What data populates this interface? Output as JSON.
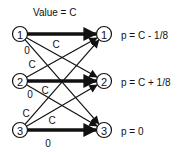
{
  "diagram": {
    "title": "Value = C",
    "left_nodes": [
      {
        "id": "1",
        "label": "1",
        "x": 20,
        "y": 34
      },
      {
        "id": "2",
        "label": "2",
        "x": 20,
        "y": 81
      },
      {
        "id": "3",
        "label": "3",
        "x": 20,
        "y": 130
      }
    ],
    "right_nodes": [
      {
        "id": "1",
        "label": "1",
        "x": 104,
        "y": 34,
        "prob": "p = C - 1/8"
      },
      {
        "id": "2",
        "label": "2",
        "x": 104,
        "y": 81,
        "prob": "p = C + 1/8"
      },
      {
        "id": "3",
        "label": "3",
        "x": 104,
        "y": 130,
        "prob": "p = 0"
      }
    ],
    "edge_labels": [
      {
        "text": "C",
        "x": 56,
        "y": 44
      },
      {
        "text": "0",
        "x": 27,
        "y": 50
      },
      {
        "text": "C",
        "x": 32,
        "y": 64
      },
      {
        "text": "C",
        "x": 45,
        "y": 90
      },
      {
        "text": "0",
        "x": 30,
        "y": 94
      },
      {
        "text": "C",
        "x": 26,
        "y": 113
      },
      {
        "text": "C",
        "x": 52,
        "y": 120
      },
      {
        "text": "0",
        "x": 48,
        "y": 143
      }
    ],
    "thick_edges": [
      {
        "from": "L1",
        "to": "R1"
      },
      {
        "from": "L2",
        "to": "R2"
      },
      {
        "from": "L3",
        "to": "R3"
      }
    ],
    "thin_edges": [
      {
        "from": "L1",
        "to": "R2"
      },
      {
        "from": "L1",
        "to": "R3"
      },
      {
        "from": "L2",
        "to": "R1"
      },
      {
        "from": "L2",
        "to": "R3"
      },
      {
        "from": "L3",
        "to": "R1"
      },
      {
        "from": "L3",
        "to": "R2"
      }
    ]
  }
}
